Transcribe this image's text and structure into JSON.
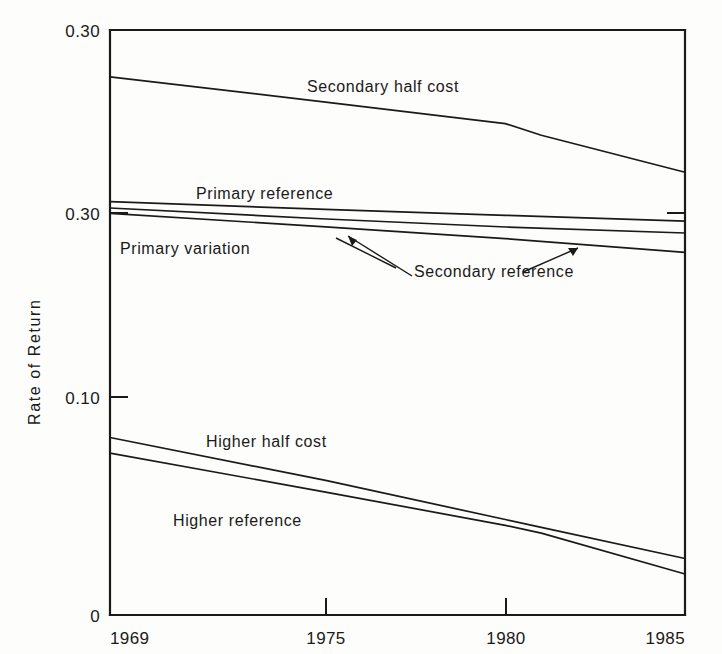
{
  "chart_data": {
    "type": "line",
    "title": "",
    "subtitle": "",
    "xlabel": "",
    "ylabel": "Rate of Return",
    "xlim": [
      1969,
      1985
    ],
    "ylim": [
      0,
      0.3
    ],
    "grid": false,
    "legend_position": "inline-annotations",
    "x_ticks": [
      "1969",
      "1975",
      "1980",
      "1985"
    ],
    "x_tick_values": [
      1969,
      1975,
      1980,
      1985
    ],
    "y_ticks": [
      "0.30",
      "0.30",
      "0.10",
      "0"
    ],
    "y_tick_values": [
      0.3,
      0.2,
      0.1,
      0
    ],
    "note_on_y_ticks": "Second tick from top is printed as 0.30 in the original figure though it sits at the 0.20 position.",
    "series": [
      {
        "name": "Secondary half cost",
        "label": "Secondary half cost",
        "x": [
          1969,
          1975,
          1980,
          1981,
          1985
        ],
        "values": [
          0.276,
          0.263,
          0.252,
          0.246,
          0.227
        ]
      },
      {
        "name": "Primary reference",
        "label": "Primary reference",
        "x": [
          1969,
          1975,
          1980,
          1985
        ],
        "values": [
          0.212,
          0.208,
          0.205,
          0.202
        ]
      },
      {
        "name": "Secondary reference upper",
        "label": "Secondary reference",
        "x": [
          1969,
          1975,
          1980,
          1985
        ],
        "values": [
          0.209,
          0.203,
          0.199,
          0.196
        ]
      },
      {
        "name": "Primary variation",
        "label": "Primary variation",
        "x": [
          1969,
          1975,
          1980,
          1985
        ],
        "values": [
          0.206,
          0.199,
          0.193,
          0.186
        ]
      },
      {
        "name": "Higher half cost",
        "label": "Higher half cost",
        "x": [
          1969,
          1975,
          1980,
          1981,
          1985
        ],
        "values": [
          0.091,
          0.069,
          0.049,
          0.045,
          0.029
        ]
      },
      {
        "name": "Higher reference",
        "label": "Higher reference",
        "x": [
          1969,
          1975,
          1980,
          1981,
          1985
        ],
        "values": [
          0.083,
          0.063,
          0.046,
          0.042,
          0.021
        ]
      }
    ],
    "annotations": [
      {
        "text": "Secondary half cost",
        "x": 1977.0,
        "y": 0.272
      },
      {
        "text": "Primary reference",
        "x": 1973.2,
        "y": 0.222
      },
      {
        "text": "Primary variation",
        "x": 1970.6,
        "y": 0.186
      },
      {
        "text": "Secondary reference",
        "x": 1977.4,
        "y": 0.179
      },
      {
        "text": "Higher half cost",
        "x": 1974.0,
        "y": 0.092
      },
      {
        "text": "Higher reference",
        "x": 1972.6,
        "y": 0.049
      }
    ]
  },
  "labels": {
    "y_axis_title": "Rate of Return",
    "y_tick_top": "0.30",
    "y_tick_mid": "0.30",
    "y_tick_low": "0.10",
    "y_tick_zero": "0",
    "x_tick_1": "1969",
    "x_tick_2": "1975",
    "x_tick_3": "1980",
    "x_tick_4": "1985",
    "series_secondary_half_cost": "Secondary half cost",
    "series_primary_reference": "Primary reference",
    "series_primary_variation": "Primary variation",
    "series_secondary_reference": "Secondary reference",
    "series_higher_half_cost": "Higher half cost",
    "series_higher_reference": "Higher reference"
  },
  "colors": {
    "ink": "#1a1a1a",
    "paper": "#fdfdfb"
  }
}
